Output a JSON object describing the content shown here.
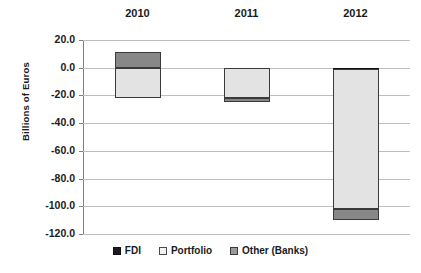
{
  "chart_data": {
    "type": "bar",
    "subtype": "stacked-bar",
    "title": "",
    "xlabel": "",
    "ylabel": "Billions of Euros",
    "categories": [
      "2010",
      "2011",
      "2012"
    ],
    "ylim": [
      -120.0,
      20.0
    ],
    "ytick_labels": [
      "20.0",
      "0.0",
      "-20.0",
      "-40.0",
      "-60.0",
      "-80.0",
      "-100.0",
      "-120.0"
    ],
    "ytick_values": [
      20.0,
      0.0,
      -20.0,
      -40.0,
      -60.0,
      -80.0,
      -100.0,
      -120.0
    ],
    "grid": true,
    "legend_position": "bottom",
    "category_axis_position": "top",
    "series": [
      {
        "name": "FDI",
        "color": "#1c1c1c",
        "values": [
          0.0,
          0.0,
          -1.0
        ]
      },
      {
        "name": "Portfolio",
        "color": "#e3e3e3",
        "values": [
          -22.0,
          -22.0,
          -101.0
        ]
      },
      {
        "name": "Other (Banks)",
        "color": "#878787",
        "values": [
          11.0,
          -2.5,
          -8.0
        ]
      }
    ],
    "bar_totals_negative": [
      -22.0,
      -24.5,
      -110.0
    ],
    "bar_totals_positive": [
      11.0,
      0.0,
      0.0
    ]
  },
  "axis": {
    "y_title": "Billions of Euros"
  },
  "legend": {
    "items": [
      {
        "label": "FDI",
        "swatch": "fdi-swatch"
      },
      {
        "label": "Portfolio",
        "swatch": "portfolio-swatch"
      },
      {
        "label": "Other (Banks)",
        "swatch": "other-banks-swatch"
      }
    ]
  }
}
